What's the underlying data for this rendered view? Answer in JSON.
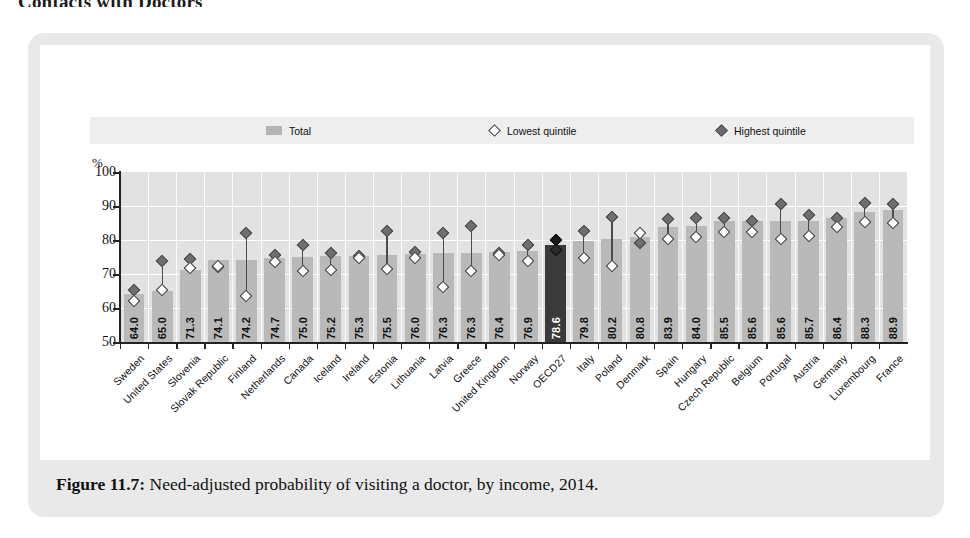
{
  "section_heading": "Contacts with Doctors",
  "legend": {
    "total_label": "Total",
    "lowest_label": "Lowest quintile",
    "highest_label": "Highest quintile"
  },
  "caption": {
    "label": "Figure 11.7:",
    "text": " Need-adjusted probability of visiting a doctor, by income, 2014."
  },
  "axis": {
    "y_unit": "%",
    "y_ticks": [
      "100",
      "90",
      "80",
      "70",
      "60",
      "50"
    ]
  },
  "chart_data": {
    "type": "bar",
    "title": "Need-adjusted probability of visiting a doctor, by income, 2014",
    "xlabel": "",
    "ylabel": "%",
    "ylim": [
      50,
      100
    ],
    "ytick_step": 10,
    "grid": true,
    "legend_position": "top",
    "highlight_category": "OECD27",
    "colors": {
      "bar": "#b9b9b9",
      "bar_highlight": "#3a3a3a",
      "lowest_quintile_marker": "#ffffff",
      "highest_quintile_marker": "#6e6e6e",
      "panel": "#e2e2e2",
      "card": "#e9e9e9"
    },
    "categories": [
      "Sweden",
      "United States",
      "Slovenia",
      "Slovak Republic",
      "Finland",
      "Netherlands",
      "Canada",
      "Iceland",
      "Ireland",
      "Estonia",
      "Lithuania",
      "Latvia",
      "Greece",
      "United Kingdom",
      "Norway",
      "OECD27",
      "Italy",
      "Poland",
      "Denmark",
      "Spain",
      "Hungary",
      "Czech Republic",
      "Belgium",
      "Portugal",
      "Austria",
      "Germany",
      "Luxembourg",
      "France"
    ],
    "series": [
      {
        "name": "Total",
        "kind": "bar",
        "values": [
          64.0,
          65.0,
          71.3,
          74.1,
          74.2,
          74.7,
          75.0,
          75.2,
          75.3,
          75.5,
          76.0,
          76.3,
          76.3,
          76.4,
          76.9,
          78.6,
          79.8,
          80.2,
          80.8,
          83.9,
          84.0,
          85.5,
          85.6,
          85.6,
          85.7,
          86.4,
          88.3,
          88.9
        ],
        "labels": [
          "64.0",
          "65.0",
          "71.3",
          "74.1",
          "74.2",
          "74.7",
          "75.0",
          "75.2",
          "75.3",
          "75.5",
          "76.0",
          "76.3",
          "76.3",
          "76.4",
          "76.9",
          "78.6",
          "79.8",
          "80.2",
          "80.8",
          "83.9",
          "84.0",
          "85.5",
          "85.6",
          "85.6",
          "85.7",
          "86.4",
          "88.3",
          "88.9"
        ]
      },
      {
        "name": "Lowest quintile",
        "kind": "marker-hollow",
        "values": [
          62.0,
          65.4,
          71.8,
          72.3,
          63.4,
          73.4,
          71.0,
          71.2,
          74.6,
          71.5,
          74.8,
          66.3,
          71.0,
          75.7,
          73.9,
          77.0,
          74.7,
          72.5,
          82.2,
          80.2,
          80.9,
          82.4,
          82.5,
          80.3,
          81.3,
          83.7,
          85.3,
          84.9
        ]
      },
      {
        "name": "Highest quintile",
        "kind": "marker-filled",
        "values": [
          65.4,
          73.8,
          74.4,
          72.2,
          82.1,
          75.6,
          78.6,
          76.2,
          75.3,
          82.7,
          76.6,
          82.2,
          84.0,
          76.3,
          78.6,
          80.0,
          82.7,
          86.7,
          79.2,
          86.2,
          86.5,
          86.5,
          85.5,
          90.7,
          87.4,
          86.5,
          90.9,
          90.7
        ]
      }
    ]
  }
}
